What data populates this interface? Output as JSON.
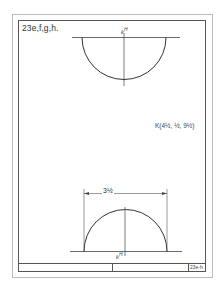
{
  "sheet": {
    "title": "23e,f,g,h.",
    "sheet_number": "23e-h"
  },
  "top_view": {
    "point_label": "k",
    "point_superscript": "H"
  },
  "bottom_view": {
    "point_label": "k",
    "point_superscript": "H",
    "dimension": "3½"
  },
  "coordinates_note": "K(4½, ½, 9½)",
  "colors": {
    "line": "#3a3a3a",
    "border": "#555555",
    "paper": "#ffffff"
  }
}
